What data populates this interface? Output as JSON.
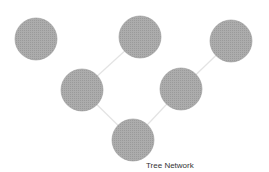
{
  "diagram": {
    "title": "Tree Network",
    "colors": {
      "node_fill": "#a6a6a6",
      "node_stroke": "#999999",
      "link": "#e3e3e3",
      "background": "#ffffff"
    },
    "nodes": [
      {
        "id": "top-left",
        "x": 36,
        "y": 39,
        "r": 21
      },
      {
        "id": "top-middle",
        "x": 140,
        "y": 37,
        "r": 21
      },
      {
        "id": "top-right",
        "x": 231,
        "y": 41,
        "r": 21
      },
      {
        "id": "mid-left",
        "x": 82,
        "y": 90,
        "r": 21
      },
      {
        "id": "mid-right",
        "x": 181,
        "y": 89,
        "r": 21
      },
      {
        "id": "bottom",
        "x": 133,
        "y": 140,
        "r": 21
      }
    ],
    "links": [
      {
        "from": "mid-left",
        "to": "top-middle"
      },
      {
        "from": "mid-right",
        "to": "top-right"
      },
      {
        "from": "bottom",
        "to": "mid-left"
      },
      {
        "from": "bottom",
        "to": "mid-right"
      }
    ]
  }
}
